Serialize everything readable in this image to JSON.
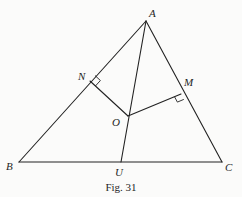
{
  "figure": {
    "caption": "Fig. 31",
    "background": "#fbfbfa",
    "line_color": "#222222",
    "points": {
      "A": {
        "label": "A",
        "x": 146,
        "y": 21
      },
      "B": {
        "label": "B",
        "x": 19,
        "y": 162
      },
      "C": {
        "label": "C",
        "x": 222,
        "y": 162
      },
      "N": {
        "label": "N",
        "x": 90,
        "y": 81
      },
      "M": {
        "label": "M",
        "x": 181,
        "y": 94
      },
      "O": {
        "label": "O",
        "x": 128,
        "y": 116
      },
      "U": {
        "label": "U",
        "x": 121,
        "y": 162
      }
    },
    "segments": [
      "AB",
      "BC",
      "CA",
      "AU",
      "ON",
      "OM"
    ],
    "right_angles": [
      "N",
      "M"
    ]
  }
}
